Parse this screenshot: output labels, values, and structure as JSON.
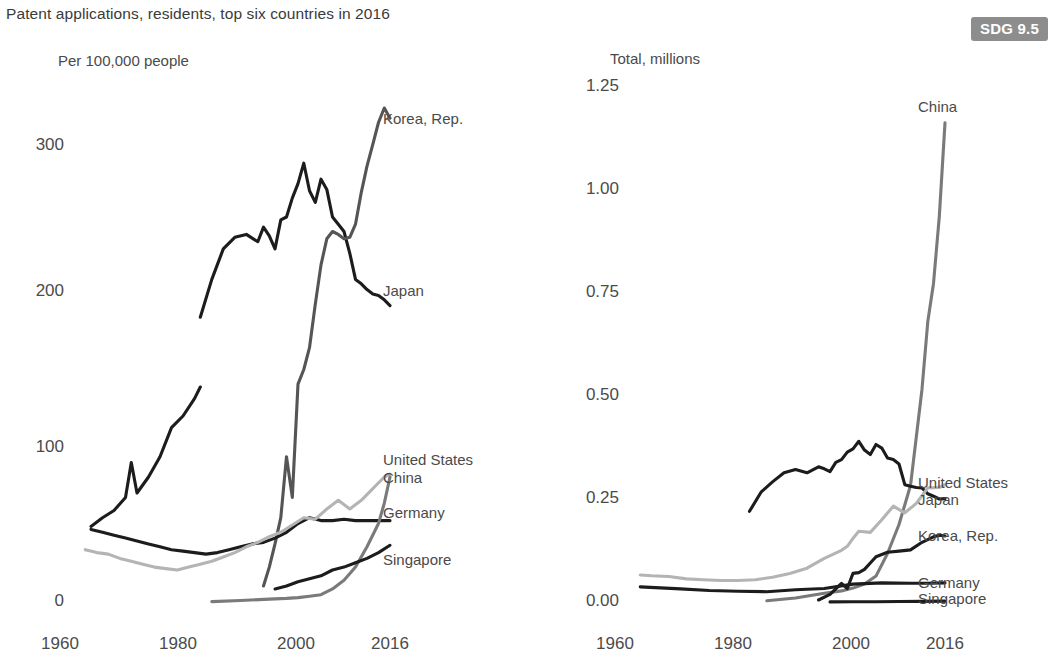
{
  "title": "Patent applications, residents, top six countries in 2016",
  "badge": "SDG 9.5",
  "colors": {
    "near_black": "#1c1c1c",
    "dark_gray": "#555555",
    "mid_gray": "#7a7a7a",
    "light_gray": "#b4b4b4",
    "badge_bg": "#8d8d8d",
    "text": "#4a4a4a"
  },
  "charts": [
    {
      "id": "left",
      "axis_title": "Per 100,000 people",
      "yticks": [
        "0",
        "100",
        "200",
        "300"
      ],
      "xticks": [
        "1960",
        "1980",
        "2000",
        "2016"
      ],
      "labels": [
        {
          "name": "Korea, Rep."
        },
        {
          "name": "Japan"
        },
        {
          "name": "United States"
        },
        {
          "name": "China"
        },
        {
          "name": "Germany"
        },
        {
          "name": "Singapore"
        }
      ]
    },
    {
      "id": "right",
      "axis_title": "Total, millions",
      "yticks": [
        "0.00",
        "0.25",
        "0.50",
        "0.75",
        "1.00",
        "1.25"
      ],
      "xticks": [
        "1960",
        "1980",
        "2000",
        "2016"
      ],
      "labels": [
        {
          "name": "China"
        },
        {
          "name": "United States"
        },
        {
          "name": "Japan"
        },
        {
          "name": "Korea, Rep."
        },
        {
          "name": "Germany"
        },
        {
          "name": "Singapore"
        }
      ]
    }
  ],
  "chart_data": [
    {
      "type": "line",
      "title": "Patent applications, residents, top six countries in 2016",
      "subtitle": "Per 100,000 people",
      "xlabel": "",
      "ylabel": "Per 100,000 people",
      "xlim": [
        1960,
        2016
      ],
      "ylim": [
        0,
        340
      ],
      "yticks": [
        0,
        100,
        200,
        300
      ],
      "xticks": [
        1960,
        1980,
        2000,
        2016
      ],
      "grid": false,
      "legend": "right-of-line-ends",
      "series": [
        {
          "name": "Japan",
          "color": "#1c1c1c",
          "x": [
            1964,
            1966,
            1968,
            1970,
            1971,
            1972,
            1974,
            1976,
            1978,
            1980,
            1982,
            1983
          ],
          "y": [
            52,
            58,
            63,
            72,
            96,
            75,
            86,
            100,
            120,
            128,
            140,
            148
          ]
        },
        {
          "name": "Japan",
          "color": "#1c1c1c",
          "note": "continuation after 1983 - upper branch",
          "x": [
            1983,
            1985,
            1987,
            1989,
            1991,
            1993,
            1994,
            1995,
            1996,
            1997,
            1998,
            1999,
            2000,
            2001,
            2002,
            2003,
            2004,
            2005,
            2006,
            2007,
            2008,
            2009,
            2010,
            2011,
            2012,
            2013,
            2014,
            2015,
            2016
          ],
          "y": [
            196,
            222,
            243,
            251,
            253,
            248,
            258,
            252,
            243,
            263,
            265,
            278,
            288,
            302,
            283,
            275,
            291,
            284,
            265,
            260,
            255,
            240,
            222,
            219,
            215,
            212,
            211,
            208,
            204
          ]
        },
        {
          "name": "Korea, Rep.",
          "color": "#555555",
          "x": [
            1994,
            1995,
            1996,
            1997,
            1998,
            1999,
            2000,
            2001,
            2002,
            2003,
            2004,
            2005,
            2006,
            2007,
            2008,
            2009,
            2010,
            2011,
            2012,
            2013,
            2014,
            2015,
            2016
          ],
          "y": [
            11,
            24,
            40,
            58,
            100,
            72,
            150,
            160,
            175,
            205,
            232,
            250,
            255,
            253,
            250,
            251,
            260,
            282,
            300,
            315,
            330,
            340,
            333
          ]
        },
        {
          "name": "Germany",
          "color": "#1c1c1c",
          "x": [
            1964,
            1966,
            1968,
            1970,
            1972,
            1974,
            1976,
            1978,
            1980,
            1982,
            1984,
            1986,
            1988,
            1990,
            1992,
            1994,
            1996,
            1998,
            2000,
            2002,
            2004,
            2006,
            2008,
            2010,
            2012,
            2014,
            2016
          ],
          "y": [
            50,
            48,
            46,
            44,
            42,
            40,
            38,
            36,
            35,
            34,
            33,
            34,
            36,
            38,
            40,
            41,
            44,
            48,
            54,
            58,
            56,
            56,
            57,
            56,
            56,
            56,
            56
          ]
        },
        {
          "name": "United States",
          "color": "#b4b4b4",
          "x": [
            1963,
            1965,
            1967,
            1969,
            1971,
            1973,
            1975,
            1977,
            1979,
            1981,
            1983,
            1985,
            1987,
            1989,
            1991,
            1993,
            1995,
            1997,
            1999,
            2001,
            2003,
            2005,
            2007,
            2009,
            2011,
            2013,
            2015,
            2016
          ],
          "y": [
            36,
            34,
            33,
            30,
            28,
            26,
            24,
            23,
            22,
            24,
            26,
            28,
            31,
            34,
            38,
            41,
            45,
            48,
            53,
            58,
            57,
            64,
            70,
            64,
            70,
            78,
            86,
            88
          ]
        },
        {
          "name": "China",
          "color": "#7a7a7a",
          "x": [
            1985,
            1990,
            1995,
            1998,
            2000,
            2002,
            2004,
            2006,
            2008,
            2010,
            2012,
            2014,
            2015,
            2016
          ],
          "y": [
            0.3,
            1,
            2,
            2.5,
            3,
            4,
            5,
            9,
            15,
            24,
            38,
            54,
            68,
            86
          ]
        },
        {
          "name": "Singapore",
          "color": "#1c1c1c",
          "x": [
            1996,
            1998,
            2000,
            2002,
            2004,
            2006,
            2008,
            2010,
            2012,
            2014,
            2016
          ],
          "y": [
            9,
            11,
            14,
            16,
            18,
            22,
            24,
            27,
            30,
            34,
            39
          ]
        }
      ]
    },
    {
      "type": "line",
      "title": "Patent applications, residents, top six countries in 2016",
      "subtitle": "Total, millions",
      "xlabel": "",
      "ylabel": "Total, millions",
      "xlim": [
        1960,
        2016
      ],
      "ylim": [
        0.0,
        1.3
      ],
      "yticks": [
        0.0,
        0.25,
        0.5,
        0.75,
        1.0,
        1.25
      ],
      "xticks": [
        1960,
        1980,
        2000,
        2016
      ],
      "grid": false,
      "legend": "right-of-line-ends",
      "series": [
        {
          "name": "China",
          "color": "#7a7a7a",
          "x": [
            1985,
            1990,
            1995,
            1998,
            2000,
            2002,
            2004,
            2006,
            2008,
            2010,
            2012,
            2013,
            2014,
            2015,
            2016
          ],
          "y": [
            0.003,
            0.01,
            0.022,
            0.028,
            0.035,
            0.045,
            0.065,
            0.122,
            0.195,
            0.293,
            0.535,
            0.705,
            0.801,
            0.969,
            1.205
          ]
        },
        {
          "name": "Japan",
          "color": "#1c1c1c",
          "x": [
            1982,
            1984,
            1986,
            1988,
            1990,
            1992,
            1994,
            1995,
            1996,
            1997,
            1998,
            1999,
            2000,
            2001,
            2002,
            2003,
            2004,
            2005,
            2006,
            2007,
            2008,
            2009,
            2010,
            2011,
            2012,
            2013,
            2014,
            2015,
            2016
          ],
          "y": [
            0.228,
            0.276,
            0.302,
            0.325,
            0.333,
            0.325,
            0.34,
            0.335,
            0.328,
            0.351,
            0.358,
            0.377,
            0.385,
            0.404,
            0.382,
            0.371,
            0.396,
            0.387,
            0.362,
            0.358,
            0.347,
            0.295,
            0.291,
            0.288,
            0.287,
            0.272,
            0.266,
            0.259,
            0.26
          ]
        },
        {
          "name": "United States",
          "color": "#b4b4b4",
          "x": [
            1963,
            1965,
            1968,
            1971,
            1974,
            1977,
            1980,
            1983,
            1986,
            1989,
            1992,
            1995,
            1998,
            1999,
            2000,
            2001,
            2003,
            2005,
            2007,
            2009,
            2011,
            2013,
            2015,
            2016
          ],
          "y": [
            0.068,
            0.066,
            0.064,
            0.058,
            0.056,
            0.054,
            0.054,
            0.056,
            0.062,
            0.072,
            0.085,
            0.11,
            0.13,
            0.14,
            0.16,
            0.178,
            0.175,
            0.207,
            0.241,
            0.224,
            0.248,
            0.287,
            0.288,
            0.295
          ]
        },
        {
          "name": "Korea, Rep.",
          "color": "#1c1c1c",
          "x": [
            1994,
            1996,
            1998,
            1999,
            2000,
            2001,
            2002,
            2003,
            2004,
            2006,
            2008,
            2010,
            2012,
            2014,
            2015,
            2016
          ],
          "y": [
            0.005,
            0.019,
            0.047,
            0.034,
            0.072,
            0.074,
            0.082,
            0.098,
            0.114,
            0.125,
            0.128,
            0.131,
            0.15,
            0.164,
            0.168,
            0.166
          ]
        },
        {
          "name": "Germany",
          "color": "#1c1c1c",
          "x": [
            1963,
            1970,
            1975,
            1980,
            1985,
            1990,
            1995,
            2000,
            2005,
            2010,
            2013,
            2016
          ],
          "y": [
            0.038,
            0.033,
            0.029,
            0.027,
            0.026,
            0.031,
            0.034,
            0.045,
            0.048,
            0.047,
            0.047,
            0.048
          ]
        },
        {
          "name": "Singapore",
          "color": "#1c1c1c",
          "x": [
            1996,
            2000,
            2004,
            2008,
            2012,
            2016
          ],
          "y": [
            0.0003,
            0.0006,
            0.0008,
            0.0012,
            0.0016,
            0.0022
          ]
        }
      ]
    }
  ]
}
